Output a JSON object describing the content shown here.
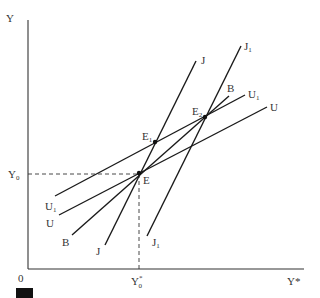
{
  "diagram": {
    "axes": {
      "y_label": "Y",
      "x_label": "Y*",
      "origin_label": "0",
      "y_tick_label": {
        "main": "Y",
        "sub": "0"
      },
      "x_tick_label": {
        "main": "Y",
        "sup": "*",
        "sub": "0"
      }
    },
    "curves": [
      {
        "id": "J",
        "label": "J",
        "label_sub": "",
        "x1": 105,
        "y1": 245,
        "x2": 196,
        "y2": 61
      },
      {
        "id": "J1",
        "label": "J",
        "label_sub": "1",
        "x1": 147,
        "y1": 236,
        "x2": 241,
        "y2": 46
      },
      {
        "id": "B",
        "label": "B",
        "label_sub": "",
        "x1": 72,
        "y1": 235,
        "x2": 229,
        "y2": 96
      },
      {
        "id": "U",
        "label": "U",
        "label_sub": "",
        "x1": 59,
        "y1": 215,
        "x2": 267,
        "y2": 107
      },
      {
        "id": "U1",
        "label": "U",
        "label_sub": "1",
        "x1": 55,
        "y1": 196,
        "x2": 245,
        "y2": 95
      }
    ],
    "points": [
      {
        "id": "E",
        "label": "E",
        "label_sub": "",
        "x": 139,
        "y": 173
      },
      {
        "id": "E1",
        "label": "E",
        "label_sub": "1",
        "x": 155,
        "y": 142
      },
      {
        "id": "E2",
        "label": "E",
        "label_sub": "2",
        "x": 205,
        "y": 117
      }
    ],
    "bottom_labels": {
      "U1": {
        "main": "U",
        "sub": "1"
      },
      "U": {
        "main": "U"
      },
      "B": {
        "main": "B"
      },
      "J": {
        "main": "J"
      },
      "J1": {
        "main": "J",
        "sub": "1"
      }
    },
    "top_labels": {
      "J": {
        "main": "J"
      },
      "J1": {
        "main": "J",
        "sub": "1"
      },
      "B": {
        "main": "B"
      },
      "U1": {
        "main": "U",
        "sub": "1"
      },
      "U": {
        "main": "U"
      }
    }
  }
}
